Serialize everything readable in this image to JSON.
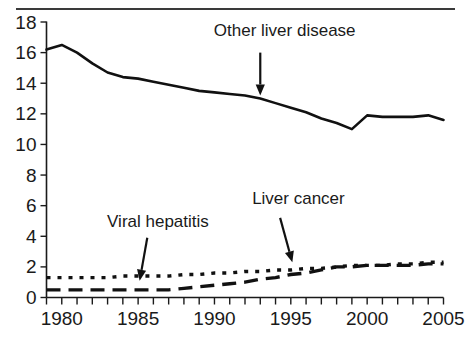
{
  "chart_data": {
    "type": "line",
    "title": "",
    "subtitle": "",
    "xlabel": "",
    "ylabel": "",
    "xlim": [
      1979,
      2005
    ],
    "ylim": [
      0,
      18
    ],
    "grid": false,
    "legend_position": "none",
    "y_ticks": [
      0,
      2,
      4,
      6,
      8,
      10,
      12,
      14,
      16,
      18
    ],
    "y_tick_labels": [
      "0",
      "2",
      "4",
      "6",
      "8",
      "10",
      "12",
      "14",
      "16",
      "18"
    ],
    "x_ticks": [
      1980,
      1985,
      1990,
      1995,
      2000,
      2005
    ],
    "x_tick_labels": [
      "1980",
      "1985",
      "1990",
      "1995",
      "2000",
      "2005"
    ],
    "x_minor_tick_interval": 1,
    "x": [
      1979,
      1980,
      1981,
      1982,
      1983,
      1984,
      1985,
      1986,
      1987,
      1988,
      1989,
      1990,
      1991,
      1992,
      1993,
      1994,
      1995,
      1996,
      1997,
      1998,
      1999,
      2000,
      2001,
      2002,
      2003,
      2004,
      2005
    ],
    "series": [
      {
        "name": "Other liver disease",
        "style": "solid",
        "values": [
          16.2,
          16.5,
          16.0,
          15.3,
          14.7,
          14.4,
          14.3,
          14.1,
          13.9,
          13.7,
          13.5,
          13.4,
          13.3,
          13.2,
          13.0,
          12.7,
          12.4,
          12.1,
          11.7,
          11.4,
          11.0,
          11.9,
          11.8,
          11.8,
          11.8,
          11.9,
          11.6
        ]
      },
      {
        "name": "Viral hepatitis",
        "style": "dotted",
        "values": [
          1.3,
          1.3,
          1.3,
          1.3,
          1.3,
          1.4,
          1.4,
          1.4,
          1.4,
          1.5,
          1.5,
          1.6,
          1.6,
          1.7,
          1.7,
          1.8,
          1.8,
          1.9,
          1.9,
          2.0,
          2.1,
          2.1,
          2.1,
          2.2,
          2.2,
          2.3,
          2.3
        ]
      },
      {
        "name": "Liver cancer",
        "style": "dashed",
        "values": [
          0.5,
          0.5,
          0.5,
          0.5,
          0.5,
          0.5,
          0.5,
          0.5,
          0.5,
          0.6,
          0.7,
          0.8,
          0.9,
          1.0,
          1.2,
          1.3,
          1.5,
          1.6,
          1.8,
          2.0,
          2.0,
          2.1,
          2.1,
          2.1,
          2.1,
          2.2,
          2.2
        ]
      }
    ],
    "annotations": [
      {
        "text": "Other liver disease",
        "label_x": 1994.6,
        "label_y": 17.1,
        "arrow_from_x": 1993.0,
        "arrow_from_y": 16.0,
        "arrow_to_x": 1993.0,
        "arrow_to_y": 13.2
      },
      {
        "text": "Viral hepatitis",
        "label_x": 1986.3,
        "label_y": 4.6,
        "arrow_from_x": 1985.6,
        "arrow_from_y": 3.9,
        "arrow_to_x": 1985.1,
        "arrow_to_y": 1.1
      },
      {
        "text": "Liver cancer",
        "label_x": 1995.5,
        "label_y": 6.1,
        "arrow_from_x": 1994.3,
        "arrow_from_y": 5.2,
        "arrow_to_x": 1995.1,
        "arrow_to_y": 2.3
      }
    ],
    "colors": {
      "series_line": "#111111",
      "axis": "#1a1a1a",
      "text": "#1a1a1a",
      "background": "#ffffff",
      "top_rule": "#3a3a3a"
    }
  }
}
